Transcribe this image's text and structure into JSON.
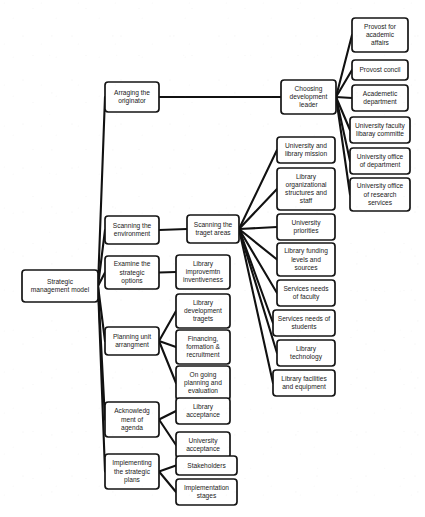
{
  "diagram": {
    "type": "hierarchical-mind-map",
    "orientation": "left-to-right",
    "style": {
      "node_fill": "#ffffff",
      "node_stroke": "#141414",
      "edge_color": "#111111",
      "text_color": "#1a1a1a",
      "background": "#ffffff"
    },
    "caption": "",
    "nodes": [
      {
        "id": "root",
        "label": "Strategic\nmanagement model",
        "x": 22,
        "y": 270,
        "w": 76,
        "h": 32,
        "font": 6.6,
        "level": 0
      },
      {
        "id": "l1",
        "label": "Arraging the\noriginator",
        "x": 105,
        "y": 82,
        "w": 54,
        "h": 30,
        "font": 6.6,
        "level": 1
      },
      {
        "id": "l2",
        "label": "Scanning the\nenvironment",
        "x": 105,
        "y": 216,
        "w": 54,
        "h": 28,
        "font": 6.6,
        "level": 1
      },
      {
        "id": "l3",
        "label": "Examine the\nstrategic\noptions",
        "x": 105,
        "y": 256,
        "w": 54,
        "h": 33,
        "font": 6.6,
        "level": 1
      },
      {
        "id": "l4",
        "label": "Planning unit\narrangment",
        "x": 105,
        "y": 327,
        "w": 54,
        "h": 28,
        "font": 6.6,
        "level": 1
      },
      {
        "id": "l5",
        "label": "Acknowledg\nment of\nagenda",
        "x": 105,
        "y": 402,
        "w": 54,
        "h": 35,
        "font": 6.6,
        "level": 1
      },
      {
        "id": "l6",
        "label": "Implementing\nthe strategic\nplans",
        "x": 105,
        "y": 454,
        "w": 54,
        "h": 35,
        "font": 6.6,
        "level": 1
      },
      {
        "id": "m1",
        "label": "Choosing\ndevelopment\nleader",
        "x": 281,
        "y": 80,
        "w": 55,
        "h": 34,
        "font": 6.6,
        "level": 2
      },
      {
        "id": "m2",
        "label": "Scanning the\ntraget areas",
        "x": 187,
        "y": 215,
        "w": 52,
        "h": 28,
        "font": 6.6,
        "level": 2
      },
      {
        "id": "m3",
        "label": "Library\nimprovemtn\ninventiveness",
        "x": 176,
        "y": 255,
        "w": 54,
        "h": 34,
        "font": 6.6,
        "level": 2
      },
      {
        "id": "m4",
        "label": "Library\ndevelopment\ntragets",
        "x": 176,
        "y": 294,
        "w": 54,
        "h": 34,
        "font": 6.6,
        "level": 2
      },
      {
        "id": "m5",
        "label": "Financing,\nformation &\nrecruitment",
        "x": 176,
        "y": 330,
        "w": 54,
        "h": 34,
        "font": 6.6,
        "level": 2
      },
      {
        "id": "m6",
        "label": "On going\nplanning and\nevaluation",
        "x": 176,
        "y": 366,
        "w": 54,
        "h": 34,
        "font": 6.6,
        "level": 2
      },
      {
        "id": "m7",
        "label": "Library\nacceptance",
        "x": 176,
        "y": 398,
        "w": 54,
        "h": 26,
        "font": 6.6,
        "level": 2
      },
      {
        "id": "m8",
        "label": "University\nacceptance",
        "x": 176,
        "y": 432,
        "w": 54,
        "h": 26,
        "font": 6.6,
        "level": 2
      },
      {
        "id": "m9",
        "label": "Stakeholders",
        "x": 176,
        "y": 456,
        "w": 61,
        "h": 19,
        "font": 6.6,
        "level": 2
      },
      {
        "id": "m10",
        "label": "Implementation\nstages",
        "x": 176,
        "y": 479,
        "w": 61,
        "h": 26,
        "font": 6.6,
        "level": 2
      },
      {
        "id": "r1",
        "label": "Provost for\nacademic\naffairs",
        "x": 352,
        "y": 18,
        "w": 56,
        "h": 34,
        "font": 6.6,
        "level": 3
      },
      {
        "id": "r2",
        "label": "Provost concil",
        "x": 352,
        "y": 60,
        "w": 56,
        "h": 20,
        "font": 6.6,
        "level": 3
      },
      {
        "id": "r3",
        "label": "Academetic\ndepartment",
        "x": 352,
        "y": 85,
        "w": 56,
        "h": 26,
        "font": 6.6,
        "level": 3
      },
      {
        "id": "r4",
        "label": "University faculty\nlibaray committe",
        "x": 350,
        "y": 117,
        "w": 60,
        "h": 26,
        "font": 6.6,
        "level": 3
      },
      {
        "id": "r5",
        "label": "University office\nof department",
        "x": 350,
        "y": 148,
        "w": 60,
        "h": 26,
        "font": 6.6,
        "level": 3
      },
      {
        "id": "r6",
        "label": "University office\nof research\nservices",
        "x": 350,
        "y": 178,
        "w": 60,
        "h": 33,
        "font": 6.6,
        "level": 3
      },
      {
        "id": "s1",
        "label": "University and\nlibrary mission",
        "x": 277,
        "y": 137,
        "w": 58,
        "h": 26,
        "font": 6.6,
        "level": 3
      },
      {
        "id": "s2",
        "label": "Library\norganizational\nstructures and\nstaff",
        "x": 277,
        "y": 168,
        "w": 58,
        "h": 42,
        "font": 6.6,
        "level": 3
      },
      {
        "id": "s3",
        "label": "University\npriorities",
        "x": 277,
        "y": 214,
        "w": 58,
        "h": 26,
        "font": 6.6,
        "level": 3
      },
      {
        "id": "s4",
        "label": "Library funding\nlevels and\nsources",
        "x": 277,
        "y": 243,
        "w": 58,
        "h": 33,
        "font": 6.6,
        "level": 3
      },
      {
        "id": "s5",
        "label": "Services needs\nof faculty",
        "x": 277,
        "y": 280,
        "w": 58,
        "h": 26,
        "font": 6.6,
        "level": 3
      },
      {
        "id": "s6",
        "label": "Services needs of\nstudents",
        "x": 273,
        "y": 310,
        "w": 62,
        "h": 26,
        "font": 6.6,
        "level": 3
      },
      {
        "id": "s7",
        "label": "Library\ntechnology",
        "x": 277,
        "y": 340,
        "w": 58,
        "h": 26,
        "font": 6.6,
        "level": 3
      },
      {
        "id": "s8",
        "label": "Library facilities\nand equipment",
        "x": 273,
        "y": 370,
        "w": 62,
        "h": 26,
        "font": 6.6,
        "level": 3
      }
    ],
    "edges": [
      {
        "from": "root",
        "to": "l1"
      },
      {
        "from": "root",
        "to": "l2"
      },
      {
        "from": "root",
        "to": "l3"
      },
      {
        "from": "root",
        "to": "l4"
      },
      {
        "from": "root",
        "to": "l5"
      },
      {
        "from": "root",
        "to": "l6"
      },
      {
        "from": "l1",
        "to": "m1"
      },
      {
        "from": "l2",
        "to": "m2"
      },
      {
        "from": "l3",
        "to": "m3"
      },
      {
        "from": "l4",
        "to": "m4"
      },
      {
        "from": "l4",
        "to": "m5"
      },
      {
        "from": "l4",
        "to": "m6"
      },
      {
        "from": "l5",
        "to": "m7"
      },
      {
        "from": "l5",
        "to": "m8"
      },
      {
        "from": "l6",
        "to": "m9"
      },
      {
        "from": "l6",
        "to": "m10"
      },
      {
        "from": "m1",
        "to": "r1"
      },
      {
        "from": "m1",
        "to": "r2"
      },
      {
        "from": "m1",
        "to": "r3"
      },
      {
        "from": "m1",
        "to": "r4"
      },
      {
        "from": "m1",
        "to": "r5"
      },
      {
        "from": "m1",
        "to": "r6"
      },
      {
        "from": "m2",
        "to": "s1"
      },
      {
        "from": "m2",
        "to": "s2"
      },
      {
        "from": "m2",
        "to": "s3"
      },
      {
        "from": "m2",
        "to": "s4"
      },
      {
        "from": "m2",
        "to": "s5"
      },
      {
        "from": "m2",
        "to": "s6"
      },
      {
        "from": "m2",
        "to": "s7"
      },
      {
        "from": "m2",
        "to": "s8"
      }
    ]
  }
}
